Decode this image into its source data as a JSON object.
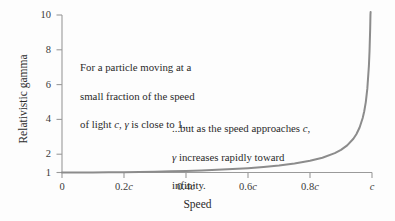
{
  "chart_data": {
    "type": "line",
    "title": "",
    "xlabel": "Speed",
    "ylabel": "Relativistic gamma",
    "xlim": [
      0,
      1
    ],
    "ylim": [
      1,
      10
    ],
    "grid": false,
    "legend": "none",
    "x_tick_labels": [
      "0",
      "0.2c",
      "0.4c",
      "0.6c",
      "0.8c",
      "c"
    ],
    "x_tick_values": [
      0,
      0.2,
      0.4,
      0.6,
      0.8,
      1
    ],
    "y_tick_labels": [
      "1",
      "2",
      "4",
      "6",
      "8",
      "10"
    ],
    "y_tick_values": [
      1,
      2,
      4,
      6,
      8,
      10
    ],
    "series": [
      {
        "name": "Lorentz factor gamma = 1 / sqrt(1 - v^2/c^2)",
        "color": "#8c8c8c",
        "x": [
          0,
          0.05,
          0.1,
          0.15,
          0.2,
          0.25,
          0.3,
          0.35,
          0.4,
          0.45,
          0.5,
          0.55,
          0.6,
          0.65,
          0.7,
          0.75,
          0.8,
          0.84,
          0.88,
          0.9,
          0.92,
          0.94,
          0.95,
          0.96,
          0.97,
          0.975,
          0.98,
          0.985,
          0.99,
          0.992,
          0.994,
          0.995,
          0.9955
        ],
        "y": [
          1.0,
          1.001,
          1.005,
          1.011,
          1.021,
          1.033,
          1.048,
          1.068,
          1.091,
          1.12,
          1.155,
          1.197,
          1.25,
          1.316,
          1.4,
          1.512,
          1.667,
          1.843,
          2.105,
          2.294,
          2.552,
          2.931,
          3.203,
          3.571,
          4.113,
          4.501,
          5.025,
          5.804,
          7.089,
          7.912,
          9.137,
          10.0,
          10.5
        ]
      }
    ],
    "annotations": [
      {
        "name": "low-speed-note",
        "text": "For a particle moving at a\nsmall fraction of the speed\nof light c, γ is close to 1..."
      },
      {
        "name": "high-speed-note",
        "text": "...but as the speed approaches c,\nγ increases rapidly toward\ninfinity."
      }
    ],
    "colors": {
      "curve": "#8c8c8c",
      "axis": "#9a9a9a",
      "text": "#2b2b2b",
      "background": "#fdfdfd"
    }
  },
  "axes": {
    "x_title": "Speed",
    "y_title": "Relativistic gamma",
    "x_ticks": [
      {
        "label": "0",
        "italic_suffix": ""
      },
      {
        "label": "0.2",
        "italic_suffix": "c"
      },
      {
        "label": "0.4",
        "italic_suffix": "c"
      },
      {
        "label": "0.6",
        "italic_suffix": "c"
      },
      {
        "label": "0.8",
        "italic_suffix": "c"
      },
      {
        "label": "",
        "italic_suffix": "c"
      }
    ],
    "y_ticks": [
      "10",
      "8",
      "6",
      "4",
      "2",
      "1"
    ]
  },
  "annotations": {
    "low_speed": {
      "line1": "For a particle moving at a",
      "line2": "small fraction of the speed",
      "line3_a": "of light ",
      "line3_c": "c",
      "line3_b": ", ",
      "line3_gamma": "γ",
      "line3_d": " is close to 1..."
    },
    "high_speed": {
      "line1_a": "...but as the speed approaches ",
      "line1_c": "c",
      "line1_b": ",",
      "line2_gamma": "γ",
      "line2_a": " increases rapidly toward",
      "line3": "infinity."
    }
  }
}
